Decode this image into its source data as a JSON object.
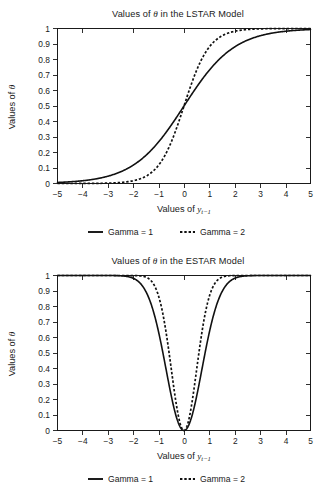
{
  "figure": {
    "background": "#ffffff",
    "ink_color": "#111111"
  },
  "panels": [
    {
      "id": "lstar",
      "title_prefix": "Values of ",
      "title_symbol": "θ",
      "title_suffix": " in the LSTAR Model",
      "title_full": "Values of θ in the LSTAR Model",
      "ylabel_prefix": "Values of ",
      "ylabel_symbol": "θ",
      "ylabel_full": "Values of θ",
      "xlabel_prefix": "Values of ",
      "xlabel_symbol": "y",
      "xlabel_subscript": "t−1",
      "xlabel_full": "Values of y t−1",
      "legend": [
        {
          "label": "Gamma = 1",
          "style": "solid"
        },
        {
          "label": "Gamma = 2",
          "style": "dashed"
        }
      ]
    },
    {
      "id": "estar",
      "title_prefix": "Values of ",
      "title_symbol": "θ",
      "title_suffix": " in the ESTAR Model",
      "title_full": "Values of θ in the ESTAR Model",
      "ylabel_prefix": "Values of ",
      "ylabel_symbol": "θ",
      "ylabel_full": "Values of θ",
      "xlabel_prefix": "Values of ",
      "xlabel_symbol": "y",
      "xlabel_subscript": "t−1",
      "xlabel_full": "Values of y t−1",
      "legend": [
        {
          "label": "Gamma = 1",
          "style": "solid"
        },
        {
          "label": "Gamma = 2",
          "style": "dashed"
        }
      ]
    }
  ],
  "chart_data": [
    {
      "type": "line",
      "id": "lstar",
      "title": "Values of θ in the LSTAR Model",
      "xlabel": "Values of y_{t-1}",
      "ylabel": "Values of θ",
      "xlim": [
        -5,
        5
      ],
      "ylim": [
        0,
        1
      ],
      "xticks": [
        -5,
        -4,
        -3,
        -2,
        -1,
        0,
        1,
        2,
        3,
        4,
        5
      ],
      "xtick_labels": [
        "−5",
        "−4",
        "−3",
        "−2",
        "−1",
        "0",
        "1",
        "2",
        "3",
        "4",
        "5"
      ],
      "yticks": [
        0,
        0.1,
        0.2,
        0.3,
        0.4,
        0.5,
        0.6,
        0.7,
        0.8,
        0.9,
        1
      ],
      "ytick_labels": [
        "0",
        "0.1",
        "0.2",
        "0.3",
        "0.4",
        "0.5",
        "0.6",
        "0.7",
        "0.8",
        "0.9",
        "1"
      ],
      "grid": false,
      "legend_position": "below",
      "formula": "theta = 1 / (1 + exp(-gamma * y))",
      "series": [
        {
          "name": "Gamma = 1",
          "style": "solid",
          "gamma": 1,
          "x": [
            -5,
            -4.5,
            -4,
            -3.5,
            -3,
            -2.5,
            -2,
            -1.5,
            -1,
            -0.5,
            0,
            0.5,
            1,
            1.5,
            2,
            2.5,
            3,
            3.5,
            4,
            4.5,
            5
          ],
          "values": [
            0.007,
            0.011,
            0.018,
            0.029,
            0.047,
            0.076,
            0.119,
            0.182,
            0.269,
            0.378,
            0.5,
            0.622,
            0.731,
            0.818,
            0.881,
            0.924,
            0.953,
            0.971,
            0.982,
            0.989,
            0.993
          ]
        },
        {
          "name": "Gamma = 2",
          "style": "dashed",
          "gamma": 2,
          "x": [
            -5,
            -4.5,
            -4,
            -3.5,
            -3,
            -2.5,
            -2,
            -1.5,
            -1,
            -0.5,
            0,
            0.5,
            1,
            1.5,
            2,
            2.5,
            3,
            3.5,
            4,
            4.5,
            5
          ],
          "values": [
            4.5e-05,
            0.00012,
            0.000335,
            0.000911,
            0.002473,
            0.006693,
            0.017986,
            0.047426,
            0.119203,
            0.268941,
            0.5,
            0.731059,
            0.880797,
            0.952574,
            0.982014,
            0.993307,
            0.997527,
            0.999089,
            0.999665,
            0.99988,
            0.999955
          ]
        }
      ]
    },
    {
      "type": "line",
      "id": "estar",
      "title": "Values of θ in the ESTAR Model",
      "xlabel": "Values of y_{t-1}",
      "ylabel": "Values of θ",
      "xlim": [
        -5,
        5
      ],
      "ylim": [
        0,
        1
      ],
      "xticks": [
        -5,
        -4,
        -3,
        -2,
        -1,
        0,
        1,
        2,
        3,
        4,
        5
      ],
      "xtick_labels": [
        "−5",
        "−4",
        "−3",
        "−2",
        "−1",
        "0",
        "1",
        "2",
        "3",
        "4",
        "5"
      ],
      "yticks": [
        0,
        0.1,
        0.2,
        0.3,
        0.4,
        0.5,
        0.6,
        0.7,
        0.8,
        0.9,
        1
      ],
      "ytick_labels": [
        "0",
        "0.1",
        "0.2",
        "0.3",
        "0.4",
        "0.5",
        "0.6",
        "0.7",
        "0.8",
        "0.9",
        "1"
      ],
      "grid": false,
      "legend_position": "below",
      "formula": "theta = 1 - exp(-gamma * y^2)",
      "series": [
        {
          "name": "Gamma = 1",
          "style": "solid",
          "gamma": 1,
          "x": [
            -3,
            -2.5,
            -2,
            -1.75,
            -1.5,
            -1.25,
            -1,
            -0.75,
            -0.5,
            -0.25,
            0,
            0.25,
            0.5,
            0.75,
            1,
            1.25,
            1.5,
            1.75,
            2,
            2.5,
            3
          ],
          "values": [
            0.99988,
            0.998,
            0.982,
            0.953,
            0.895,
            0.791,
            0.632,
            0.43,
            0.221,
            0.061,
            0,
            0.061,
            0.221,
            0.43,
            0.632,
            0.791,
            0.895,
            0.953,
            0.982,
            0.998,
            0.99988
          ]
        },
        {
          "name": "Gamma = 2",
          "style": "dashed",
          "gamma": 2,
          "x": [
            -3,
            -2.5,
            -2,
            -1.75,
            -1.5,
            -1.25,
            -1,
            -0.75,
            -0.5,
            -0.25,
            0,
            0.25,
            0.5,
            0.75,
            1,
            1.25,
            1.5,
            1.75,
            2,
            2.5,
            3
          ],
          "values": [
            1.0,
            1.0,
            0.99966,
            0.99784,
            0.98889,
            0.95606,
            0.86466,
            0.67535,
            0.39347,
            0.1175,
            0,
            0.1175,
            0.39347,
            0.67535,
            0.86466,
            0.95606,
            0.98889,
            0.99784,
            0.99966,
            1.0,
            1.0
          ]
        }
      ]
    }
  ]
}
